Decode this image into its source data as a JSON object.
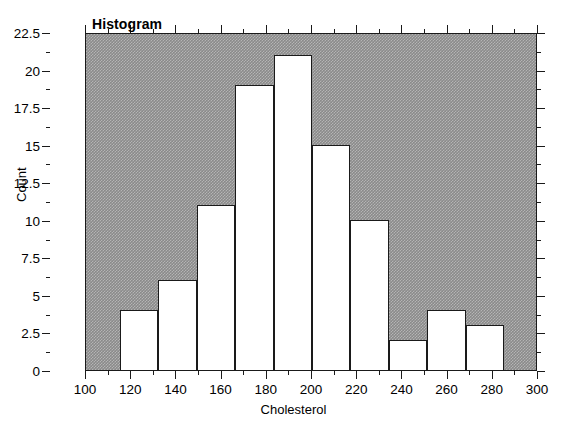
{
  "chart_data": {
    "type": "bar",
    "title": "Histogram",
    "xlabel": "Cholesterol",
    "ylabel": "Count",
    "xlim": [
      100,
      300
    ],
    "ylim": [
      0,
      22.5
    ],
    "grid": false,
    "legend": null,
    "bin_edges": [
      115,
      132,
      149,
      166,
      183,
      200,
      217,
      234,
      251,
      268,
      285
    ],
    "categories": [
      "115-132",
      "132-149",
      "149-166",
      "166-183",
      "183-200",
      "200-217",
      "217-234",
      "234-251",
      "251-268",
      "268-285"
    ],
    "values": [
      4,
      6,
      11,
      19,
      21,
      15,
      10,
      2,
      4,
      3
    ],
    "x_tick_labels": [
      "100",
      "120",
      "140",
      "160",
      "180",
      "200",
      "220",
      "240",
      "260",
      "280",
      "300"
    ],
    "x_tick_values": [
      100,
      120,
      140,
      160,
      180,
      200,
      220,
      240,
      260,
      280,
      300
    ],
    "x_minor_step": 10,
    "y_tick_labels": [
      "0",
      "2.5",
      "5",
      "7.5",
      "10",
      "12.5",
      "15",
      "17.5",
      "20",
      "22.5"
    ],
    "y_tick_values": [
      0,
      2.5,
      5,
      7.5,
      10,
      12.5,
      15,
      17.5,
      20,
      22.5
    ],
    "y_minor_step": 1.25,
    "colors": {
      "plot_background": "#8a8a8a",
      "bar_fill": "#ffffff",
      "bar_edge": "#1a1a1a",
      "axis": "#1a1a1a",
      "text": "#000000",
      "figure_background": "#ffffff"
    }
  }
}
